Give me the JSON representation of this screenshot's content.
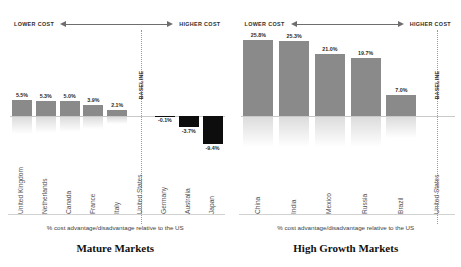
{
  "axis_header": {
    "lower_label": "LOWER COST",
    "higher_label": "HIGHER COST"
  },
  "baseline_label": "BASELINE",
  "panels": [
    {
      "id": "mature-markets",
      "title": "Mature Markets",
      "subtitle": "% cost advantage/disadvantage relative to the US",
      "baseline_country": "United States",
      "values_positive": [
        "5.5%",
        "5.3%",
        "5.0%",
        "3.9%",
        "2.1%"
      ],
      "values_negative": [
        "-0.1%",
        "-3.7%",
        "-9.4%"
      ]
    },
    {
      "id": "high-growth-markets",
      "title": "High Growth Markets",
      "subtitle": "% cost advantage/disadvantage relative to the US",
      "baseline_country": "United States",
      "values_positive": [
        "25.8%",
        "25.3%",
        "21.0%",
        "19.7%",
        "7.0%"
      ],
      "values_negative": []
    }
  ],
  "colors": {
    "positive_bar": "#8a8a8a",
    "negative_bar": "#0d0d0d",
    "zero_line": "#c9c9c9",
    "baseline_dotted": "#9a9a9a",
    "label_text": "#555555"
  },
  "chart_data": [
    {
      "type": "bar",
      "title": "Mature Markets",
      "subtitle": "% cost advantage/disadvantage relative to the US",
      "xlabel": "",
      "ylabel": "% cost advantage/disadvantage relative to the US",
      "categories": [
        "United Kingdom",
        "Netherlands",
        "Canada",
        "France",
        "Italy",
        "United States",
        "Germany",
        "Australia",
        "Japan"
      ],
      "values": [
        5.5,
        5.3,
        5.0,
        3.9,
        2.1,
        0.0,
        -0.1,
        -3.7,
        -9.4
      ],
      "data_labels": [
        "5.5%",
        "5.3%",
        "5.0%",
        "3.9%",
        "2.1%",
        "BASELINE",
        "-0.1%",
        "-3.7%",
        "-9.4%"
      ],
      "baseline_category": "United States",
      "ylim": [
        -10,
        27
      ],
      "grid": false,
      "legend": "none",
      "annotations": [
        "LOWER COST",
        "HIGHER COST",
        "BASELINE"
      ]
    },
    {
      "type": "bar",
      "title": "High Growth Markets",
      "subtitle": "% cost advantage/disadvantage relative to the US",
      "xlabel": "",
      "ylabel": "% cost advantage/disadvantage relative to the US",
      "categories": [
        "China",
        "India",
        "Mexico",
        "Russia",
        "Brazil",
        "United States"
      ],
      "values": [
        25.8,
        25.3,
        21.0,
        19.7,
        7.0,
        0.0
      ],
      "data_labels": [
        "25.8%",
        "25.3%",
        "21.0%",
        "19.7%",
        "7.0%",
        "BASELINE"
      ],
      "baseline_category": "United States",
      "ylim": [
        -10,
        27
      ],
      "grid": false,
      "legend": "none",
      "annotations": [
        "LOWER COST",
        "HIGHER COST",
        "BASELINE"
      ]
    }
  ]
}
